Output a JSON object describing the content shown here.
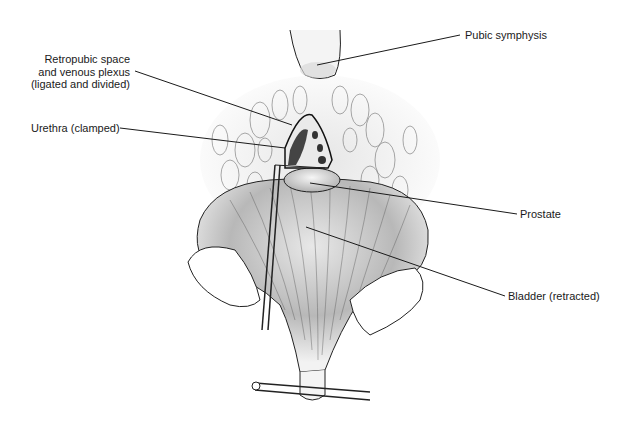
{
  "figure": {
    "labels": {
      "pubic_symphysis": "Pubic symphysis",
      "retropubic_line1": "Retropubic space",
      "retropubic_line2": "and venous plexus",
      "retropubic_line3": "(ligated and divided)",
      "urethra": "Urethra (clamped)",
      "prostate": "Prostate",
      "bladder": "Bladder (retracted)"
    },
    "colors": {
      "ink": "#1a1a1a",
      "shade": "#9a9a9a",
      "background": "#ffffff"
    }
  }
}
